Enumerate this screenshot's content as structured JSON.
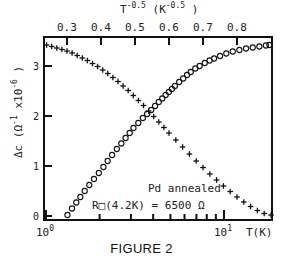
{
  "chart_data": {
    "type": "scatter",
    "title": "",
    "caption": "FIGURE 2",
    "ylabel": "Δc (Ω⁻¹ x10⁻⁶ )",
    "xlabel_bottom": "T(K)",
    "xlabel_top": "T^-0.5 (K^-0.5 )",
    "xscale_bottom": "log",
    "xlim_bottom": [
      1,
      18.6
    ],
    "xlim_top": [
      0.235,
      0.905
    ],
    "ylim": [
      0,
      3.45
    ],
    "grid": false,
    "bottom_ticks": [
      {
        "value": 1,
        "label": "10^0"
      },
      {
        "value": 10,
        "label": "10^1"
      }
    ],
    "bottom_minor_ticks": [
      2,
      3,
      4,
      5,
      6,
      7,
      8,
      9
    ],
    "top_ticks": [
      0.3,
      0.4,
      0.5,
      0.6,
      0.7,
      0.8
    ],
    "y_ticks": [
      0,
      1,
      2,
      3
    ],
    "annotations": [
      "Pd annealed",
      "R□(4.2K) = 6500 Ω"
    ],
    "series": [
      {
        "name": "circles vs T (bottom log axis)",
        "marker": "o",
        "x_axis": "bottom",
        "x": [
          1.32,
          1.4,
          1.48,
          1.56,
          1.65,
          1.75,
          1.86,
          1.98,
          2.1,
          2.22,
          2.35,
          2.5,
          2.65,
          2.8,
          2.95,
          3.1,
          3.3,
          3.5,
          3.7,
          3.9,
          4.1,
          4.3,
          4.5,
          4.7,
          4.9,
          5.1,
          5.3,
          5.6,
          5.9,
          6.2,
          6.5,
          6.9,
          7.3,
          7.8,
          8.3,
          8.8,
          9.5,
          10.3,
          11.2,
          12.2,
          13.3,
          14.5,
          15.8,
          17.2,
          18.0
        ],
        "y": [
          0.02,
          0.15,
          0.27,
          0.38,
          0.5,
          0.62,
          0.74,
          0.86,
          0.98,
          1.1,
          1.22,
          1.34,
          1.45,
          1.56,
          1.66,
          1.76,
          1.86,
          1.96,
          2.04,
          2.12,
          2.2,
          2.28,
          2.35,
          2.42,
          2.48,
          2.54,
          2.6,
          2.68,
          2.75,
          2.82,
          2.88,
          2.95,
          3.0,
          3.06,
          3.11,
          3.15,
          3.2,
          3.25,
          3.29,
          3.32,
          3.35,
          3.37,
          3.39,
          3.41,
          3.42
        ]
      },
      {
        "name": "crosses vs T^-0.5 (top linear axis)",
        "marker": "+",
        "x_axis": "top",
        "x": [
          0.24,
          0.255,
          0.27,
          0.285,
          0.3,
          0.315,
          0.33,
          0.345,
          0.36,
          0.375,
          0.39,
          0.405,
          0.42,
          0.435,
          0.45,
          0.465,
          0.48,
          0.495,
          0.51,
          0.525,
          0.54,
          0.555,
          0.57,
          0.585,
          0.6,
          0.62,
          0.64,
          0.66,
          0.68,
          0.7,
          0.72,
          0.74,
          0.76,
          0.78,
          0.8,
          0.82,
          0.84,
          0.86,
          0.88,
          0.9
        ],
        "y": [
          3.42,
          3.39,
          3.36,
          3.33,
          3.3,
          3.26,
          3.21,
          3.16,
          3.11,
          3.05,
          2.99,
          2.92,
          2.85,
          2.77,
          2.69,
          2.6,
          2.51,
          2.41,
          2.31,
          2.21,
          2.1,
          1.99,
          1.88,
          1.77,
          1.66,
          1.52,
          1.38,
          1.24,
          1.1,
          0.97,
          0.84,
          0.72,
          0.6,
          0.49,
          0.38,
          0.28,
          0.19,
          0.11,
          0.05,
          0.02
        ]
      }
    ]
  }
}
